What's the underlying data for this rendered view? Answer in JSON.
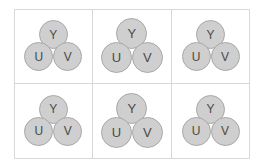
{
  "figure": {
    "background_color": "#ffffff",
    "cell_border_color": "#d8d8d8",
    "node_fill_color": "#cfcfcf",
    "node_stroke_color": "#a8a8a8",
    "node_label_color": "#4a4a4a",
    "grid": {
      "columns": 3,
      "rows": 2,
      "cell_count": 6
    }
  },
  "labels": {
    "top": "Y",
    "bottom_left": "U",
    "bottom_right": "V"
  },
  "cells": [
    {
      "index": 1,
      "row": 1,
      "column": 1,
      "size_variant": "normal",
      "nodes": [
        {
          "position": "top",
          "label": "Y"
        },
        {
          "position": "bottom-left",
          "label": "U"
        },
        {
          "position": "bottom-right",
          "label": "V"
        }
      ]
    },
    {
      "index": 2,
      "row": 1,
      "column": 2,
      "size_variant": "large",
      "nodes": [
        {
          "position": "top",
          "label": "Y"
        },
        {
          "position": "bottom-left",
          "label": "U"
        },
        {
          "position": "bottom-right",
          "label": "V"
        }
      ]
    },
    {
      "index": 3,
      "row": 1,
      "column": 3,
      "size_variant": "normal",
      "nodes": [
        {
          "position": "top",
          "label": "Y"
        },
        {
          "position": "bottom-left",
          "label": "U"
        },
        {
          "position": "bottom-right",
          "label": "V"
        }
      ]
    },
    {
      "index": 4,
      "row": 2,
      "column": 1,
      "size_variant": "normal",
      "nodes": [
        {
          "position": "top",
          "label": "Y"
        },
        {
          "position": "bottom-left",
          "label": "U"
        },
        {
          "position": "bottom-right",
          "label": "V"
        }
      ]
    },
    {
      "index": 5,
      "row": 2,
      "column": 2,
      "size_variant": "large",
      "nodes": [
        {
          "position": "top",
          "label": "Y"
        },
        {
          "position": "bottom-left",
          "label": "U"
        },
        {
          "position": "bottom-right",
          "label": "V"
        }
      ]
    },
    {
      "index": 6,
      "row": 2,
      "column": 3,
      "size_variant": "normal",
      "nodes": [
        {
          "position": "top",
          "label": "Y"
        },
        {
          "position": "bottom-left",
          "label": "U"
        },
        {
          "position": "bottom-right",
          "label": "V"
        }
      ]
    }
  ]
}
